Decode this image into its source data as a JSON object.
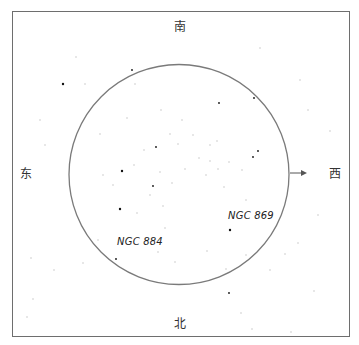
{
  "directions": {
    "south": "南",
    "north": "北",
    "east": "东",
    "west": "西"
  },
  "labels": {
    "cluster_a": "NGC 869",
    "cluster_b": "NGC 884"
  },
  "colors": {
    "frame": "#6e6e6e",
    "circle": "#7a7a7a",
    "star_bright": "#111111",
    "star_faint": "#bdbdbd",
    "arrow": "#555555"
  },
  "field_circle": {
    "cx": 179,
    "cy": 174.5,
    "r": 110
  },
  "arrow": {
    "x1": 290,
    "y1": 173,
    "x2": 307,
    "y2": 173,
    "points_to": "west"
  },
  "bright_stars": [
    [
      63,
      84
    ],
    [
      122,
      171
    ],
    [
      120,
      209
    ],
    [
      230,
      230
    ],
    [
      229,
      293
    ],
    [
      253,
      157
    ],
    [
      258,
      151
    ],
    [
      132,
      70
    ],
    [
      254,
      98
    ],
    [
      153,
      186
    ],
    [
      219,
      103
    ],
    [
      116,
      259
    ],
    [
      156,
      147
    ]
  ],
  "faint_stars": [
    [
      76,
      57
    ],
    [
      85,
      84
    ],
    [
      135,
      84
    ],
    [
      100,
      134
    ],
    [
      127,
      118
    ],
    [
      144,
      150
    ],
    [
      134,
      165
    ],
    [
      160,
      172
    ],
    [
      172,
      183
    ],
    [
      210,
      161
    ],
    [
      199,
      158
    ],
    [
      218,
      169
    ],
    [
      206,
      175
    ],
    [
      229,
      162
    ],
    [
      224,
      187
    ],
    [
      185,
      169
    ],
    [
      178,
      144
    ],
    [
      170,
      134
    ],
    [
      161,
      110
    ],
    [
      182,
      120
    ],
    [
      193,
      135
    ],
    [
      210,
      145
    ],
    [
      217,
      141
    ],
    [
      242,
      170
    ],
    [
      246,
      200
    ],
    [
      150,
      195
    ],
    [
      163,
      206
    ],
    [
      137,
      213
    ],
    [
      113,
      185
    ],
    [
      103,
      175
    ],
    [
      165,
      228
    ],
    [
      158,
      252
    ],
    [
      175,
      262
    ],
    [
      207,
      251
    ],
    [
      246,
      255
    ],
    [
      31,
      258
    ],
    [
      33,
      299
    ],
    [
      83,
      263
    ],
    [
      98,
      240
    ],
    [
      270,
      270
    ],
    [
      285,
      254
    ],
    [
      298,
      243
    ],
    [
      314,
      291
    ],
    [
      291,
      332
    ],
    [
      252,
      329
    ],
    [
      226,
      269
    ],
    [
      241,
      313
    ],
    [
      54,
      270
    ],
    [
      27,
      317
    ],
    [
      308,
      110
    ],
    [
      330,
      131
    ],
    [
      318,
      215
    ],
    [
      40,
      120
    ],
    [
      45,
      145
    ],
    [
      260,
      48
    ],
    [
      300,
      80
    ]
  ]
}
